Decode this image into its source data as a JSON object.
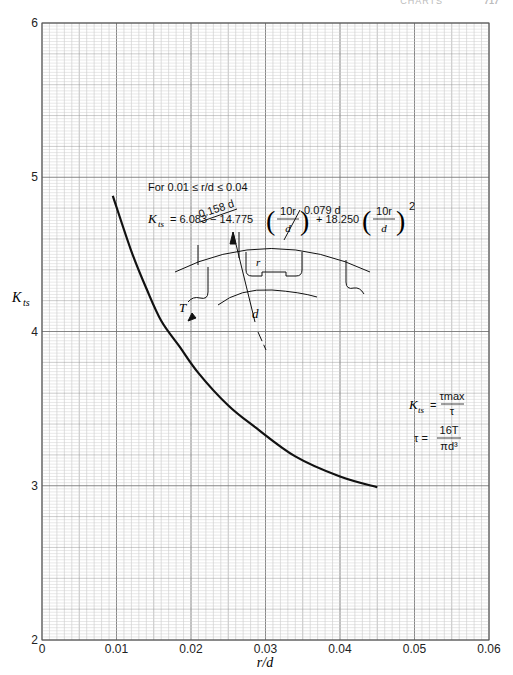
{
  "page_header": {
    "running_title": "CHARTS",
    "page_number": "717"
  },
  "chart_data": {
    "type": "line",
    "title": "",
    "xlabel": "r/d",
    "ylabel": "K_ts",
    "xlim": [
      0,
      0.06
    ],
    "ylim": [
      2,
      6
    ],
    "grid": true,
    "x_ticks": [
      "0",
      "0.01",
      "0.02",
      "0.03",
      "0.04",
      "0.05",
      "0.06"
    ],
    "y_ticks": [
      "2",
      "3",
      "4",
      "5",
      "6"
    ],
    "series": [
      {
        "name": "K_ts",
        "x": [
          0.0095,
          0.012,
          0.014,
          0.016,
          0.0185,
          0.021,
          0.025,
          0.0286,
          0.034,
          0.04,
          0.045
        ],
        "y": [
          4.88,
          4.52,
          4.28,
          4.07,
          3.9,
          3.73,
          3.52,
          3.38,
          3.19,
          3.06,
          2.99
        ]
      }
    ],
    "annotations": {
      "range_condition": "For 0.01 ≤ r/d ≤ 0.04",
      "formula_lhs": "K",
      "formula_lhs_sub": "ts",
      "formula_part1": "= 6.083 − 14.775",
      "formula_part2": "+ 18.250",
      "formula_frac_num": "10r",
      "formula_frac_den": "d",
      "formula_exponent": "2",
      "dim_width": "0.158 d",
      "dim_depth": "0.079 d",
      "label_r": "r",
      "label_T": "T",
      "label_d": "d",
      "kts_def_lhs": "K",
      "kts_def_sub": "ts",
      "kts_def_num": "τmax",
      "kts_def_den": "τ",
      "tau_def_lhs": "τ =",
      "tau_def_num": "16T",
      "tau_def_den": "πd³"
    }
  }
}
